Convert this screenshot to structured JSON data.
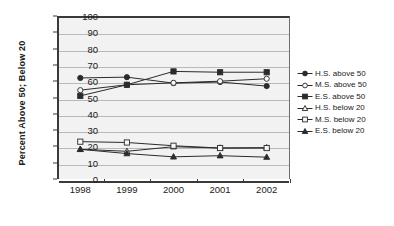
{
  "chart_data": {
    "type": "line",
    "title": "",
    "xlabel": "",
    "ylabel": "Percent Above 50; Below 20",
    "categories": [
      "1998",
      "1999",
      "2000",
      "2001",
      "2002"
    ],
    "ylim": [
      0,
      100
    ],
    "ytick_step": 10,
    "yticks": [
      "100",
      "90",
      "80",
      "70",
      "60",
      "50",
      "40",
      "30",
      "20",
      "10",
      "0"
    ],
    "grid": true,
    "legend_position": "right",
    "series": [
      {
        "name": "H.S. above 50",
        "marker": "filled-circle",
        "color": "#2b2b2b",
        "values": [
          62.0,
          62.5,
          58.8,
          59.5,
          57.0
        ]
      },
      {
        "name": "M.S. above 50",
        "marker": "open-circle",
        "color": "#2b2b2b",
        "values": [
          54.5,
          57.8,
          59.0,
          60.0,
          61.5
        ]
      },
      {
        "name": "E.S. above 50",
        "marker": "filled-square",
        "color": "#2b2b2b",
        "values": [
          51.0,
          57.8,
          66.0,
          65.5,
          65.5
        ]
      },
      {
        "name": "H.S. below 20",
        "marker": "open-triangle",
        "color": "#2b2b2b",
        "values": [
          18.2,
          17.0,
          19.8,
          19.0,
          19.2
        ]
      },
      {
        "name": "M.S. below 20",
        "marker": "open-square",
        "color": "#2b2b2b",
        "values": [
          22.9,
          22.4,
          20.4,
          19.0,
          19.0
        ]
      },
      {
        "name": "E.S. below 20",
        "marker": "filled-triangle",
        "color": "#2b2b2b",
        "values": [
          18.2,
          15.6,
          13.6,
          14.3,
          13.4
        ]
      }
    ]
  },
  "axis": {
    "y_title": "Percent Above 50; Below 20"
  },
  "legend": {
    "items": [
      {
        "label": "H.S. above 50"
      },
      {
        "label": "M.S. above 50"
      },
      {
        "label": "E.S. above 50"
      },
      {
        "label": "H.S. below 20"
      },
      {
        "label": "M.S. below 20"
      },
      {
        "label": "E.S. below 20"
      }
    ]
  }
}
